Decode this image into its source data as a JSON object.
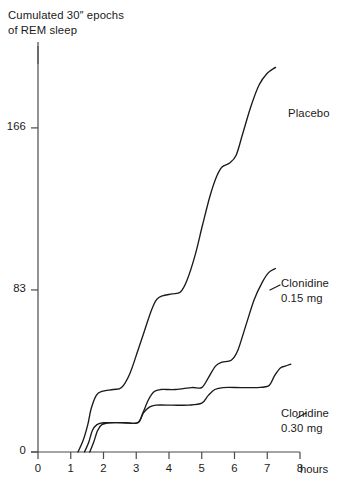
{
  "chart_data": {
    "type": "line",
    "title": "",
    "ylabel": "Cumulated 30″ epochs\nof REM sleep",
    "ylabel_line1": "Cumulated 30″ epochs",
    "ylabel_line2": "of REM sleep",
    "xlabel": "hours",
    "xlim": [
      0,
      8
    ],
    "ylim": [
      0,
      210
    ],
    "grid": false,
    "legend_position": "inline-right-of-curve-ends",
    "x_ticks": [
      0,
      1,
      2,
      3,
      4,
      5,
      6,
      7,
      8
    ],
    "x_tick_labels": [
      "0",
      "1",
      "2",
      "3",
      "4",
      "5",
      "6",
      "7",
      "8"
    ],
    "y_ticks": [
      0,
      83,
      166
    ],
    "y_tick_labels": [
      "0",
      "83",
      "166"
    ],
    "line_color": "#1a1a1a",
    "axis_color": "#4a4a4a",
    "series": [
      {
        "name": "Placebo",
        "label_lines": [
          "Placebo"
        ],
        "points": [
          [
            1.22,
            0
          ],
          [
            1.38,
            6
          ],
          [
            1.52,
            14
          ],
          [
            1.62,
            22
          ],
          [
            1.78,
            29
          ],
          [
            1.95,
            31
          ],
          [
            2.3,
            32
          ],
          [
            2.55,
            33
          ],
          [
            2.8,
            40
          ],
          [
            3.05,
            52
          ],
          [
            3.25,
            62
          ],
          [
            3.45,
            72
          ],
          [
            3.62,
            78
          ],
          [
            3.8,
            80
          ],
          [
            4.1,
            81
          ],
          [
            4.35,
            82
          ],
          [
            4.55,
            88
          ],
          [
            4.8,
            101
          ],
          [
            5.02,
            116
          ],
          [
            5.25,
            131
          ],
          [
            5.45,
            141
          ],
          [
            5.62,
            146
          ],
          [
            5.85,
            148
          ],
          [
            6.05,
            152
          ],
          [
            6.25,
            163
          ],
          [
            6.5,
            177
          ],
          [
            6.75,
            188
          ],
          [
            7.0,
            194
          ],
          [
            7.25,
            197
          ]
        ]
      },
      {
        "name": "Clonidine 0.15 mg",
        "label_lines": [
          "Clonidine",
          "0.15 mg"
        ],
        "points": [
          [
            1.42,
            0
          ],
          [
            1.55,
            5
          ],
          [
            1.66,
            11
          ],
          [
            1.8,
            14
          ],
          [
            2.0,
            15
          ],
          [
            2.6,
            15
          ],
          [
            3.05,
            15
          ],
          [
            3.2,
            20
          ],
          [
            3.38,
            27
          ],
          [
            3.55,
            31
          ],
          [
            3.75,
            32
          ],
          [
            4.2,
            32
          ],
          [
            4.7,
            33
          ],
          [
            5.0,
            33
          ],
          [
            5.2,
            38
          ],
          [
            5.42,
            44
          ],
          [
            5.62,
            46
          ],
          [
            5.9,
            47
          ],
          [
            6.1,
            52
          ],
          [
            6.35,
            65
          ],
          [
            6.6,
            78
          ],
          [
            6.85,
            87
          ],
          [
            7.05,
            92
          ],
          [
            7.25,
            94
          ]
        ]
      },
      {
        "name": "Clonidine 0.30 mg",
        "label_lines": [
          "Clonidine",
          "0.30 mg"
        ],
        "points": [
          [
            1.58,
            0
          ],
          [
            1.7,
            5
          ],
          [
            1.82,
            11
          ],
          [
            1.95,
            14
          ],
          [
            2.2,
            15
          ],
          [
            2.7,
            15
          ],
          [
            3.05,
            15
          ],
          [
            3.22,
            20
          ],
          [
            3.4,
            23
          ],
          [
            3.6,
            24
          ],
          [
            4.1,
            24
          ],
          [
            4.6,
            24
          ],
          [
            5.0,
            25
          ],
          [
            5.2,
            29
          ],
          [
            5.4,
            32
          ],
          [
            5.65,
            33
          ],
          [
            6.2,
            33
          ],
          [
            6.7,
            33
          ],
          [
            7.05,
            34
          ],
          [
            7.22,
            39
          ],
          [
            7.4,
            43
          ],
          [
            7.55,
            44
          ],
          [
            7.72,
            45
          ]
        ]
      }
    ]
  },
  "axes_geometry": {
    "x0_px": 38,
    "x8_px": 300,
    "y0_px": 452,
    "ytop_px": 42,
    "y_value_at_top": 210
  }
}
